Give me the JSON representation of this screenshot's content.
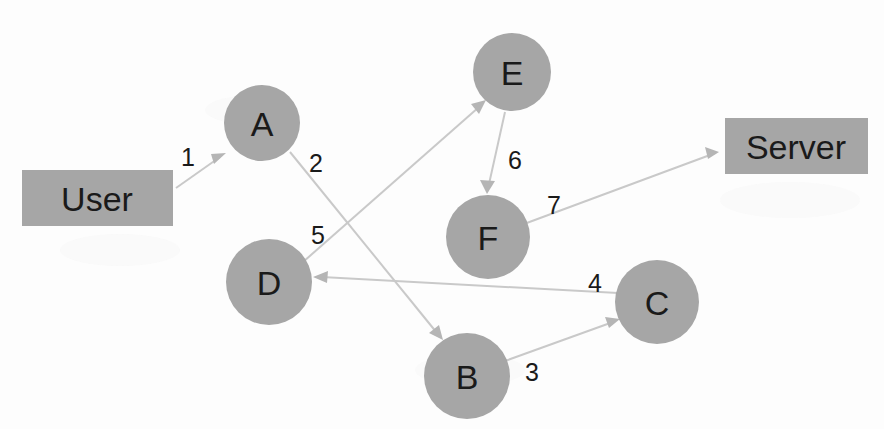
{
  "diagram": {
    "type": "directed-graph",
    "background_color": "#fdfdfd",
    "node_fill_color": "#a6a6a6",
    "edge_color": "#c9c9c9",
    "label_color": "#1a1a1a"
  },
  "nodes": [
    {
      "id": "user",
      "label": "User",
      "shape": "rect",
      "x": 22,
      "y": 170,
      "w": 151,
      "h": 56
    },
    {
      "id": "a",
      "label": "A",
      "shape": "circle",
      "cx": 262,
      "cy": 123,
      "r": 38
    },
    {
      "id": "b",
      "label": "B",
      "shape": "circle",
      "cx": 467,
      "cy": 376,
      "r": 43
    },
    {
      "id": "c",
      "label": "C",
      "shape": "circle",
      "cx": 657,
      "cy": 302,
      "r": 42
    },
    {
      "id": "d",
      "label": "D",
      "shape": "circle",
      "cx": 269,
      "cy": 282,
      "r": 43
    },
    {
      "id": "e",
      "label": "E",
      "shape": "circle",
      "cx": 512,
      "cy": 72,
      "r": 39
    },
    {
      "id": "f",
      "label": "F",
      "shape": "circle",
      "cx": 488,
      "cy": 237,
      "r": 42
    },
    {
      "id": "server",
      "label": "Server",
      "shape": "rect",
      "x": 725,
      "y": 118,
      "w": 143,
      "h": 56
    }
  ],
  "edges": [
    {
      "id": "e1",
      "label": "1",
      "from": "user",
      "to": "a",
      "x1": 176,
      "y1": 188,
      "x2": 226,
      "y2": 153,
      "lx": 188,
      "ly": 157
    },
    {
      "id": "e2",
      "label": "2",
      "from": "a",
      "to": "b",
      "x1": 290,
      "y1": 152,
      "x2": 443,
      "y2": 340,
      "lx": 316,
      "ly": 163
    },
    {
      "id": "e3",
      "label": "3",
      "from": "b",
      "to": "c",
      "x1": 505,
      "y1": 361,
      "x2": 619,
      "y2": 320,
      "lx": 532,
      "ly": 372
    },
    {
      "id": "e4",
      "label": "4",
      "from": "c",
      "to": "d",
      "x1": 618,
      "y1": 293,
      "x2": 315,
      "y2": 277,
      "lx": 595,
      "ly": 283
    },
    {
      "id": "e5",
      "label": "5",
      "from": "d",
      "to": "e",
      "x1": 303,
      "y1": 262,
      "x2": 484,
      "y2": 101,
      "lx": 318,
      "ly": 235
    },
    {
      "id": "e6",
      "label": "6",
      "from": "e",
      "to": "f",
      "x1": 505,
      "y1": 112,
      "x2": 490,
      "y2": 192,
      "lx": 515,
      "ly": 160
    },
    {
      "id": "e7",
      "label": "7",
      "from": "f",
      "to": "server",
      "x1": 524,
      "y1": 224,
      "x2": 716,
      "y2": 152,
      "lx": 554,
      "ly": 205
    }
  ],
  "sequence": {
    "description": "User -> A -> B -> C -> D -> E -> F -> Server",
    "steps": [
      "1",
      "2",
      "3",
      "4",
      "5",
      "6",
      "7"
    ]
  }
}
